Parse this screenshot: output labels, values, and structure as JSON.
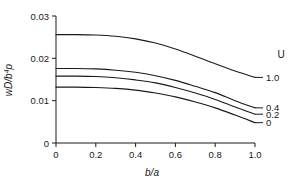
{
  "chart_data": {
    "type": "line",
    "title": "",
    "xlabel": "b/a",
    "ylabel": "wD/b4p",
    "ylabel_parts": {
      "pre": "wD/b",
      "sup": "4",
      "post": "p"
    },
    "xlim": [
      0,
      1.0
    ],
    "ylim": [
      0,
      0.03
    ],
    "grid": false,
    "legend_title": "U",
    "legend_position": "right-outside-curve-ends",
    "x_ticks": [
      0,
      0.2,
      0.4,
      0.6,
      0.8,
      1.0
    ],
    "x_tick_labels": [
      "0",
      "0.2",
      "0.4",
      "0.6",
      "0.8",
      "1.0"
    ],
    "y_ticks": [
      0,
      0.01,
      0.02,
      0.03
    ],
    "y_tick_labels": [
      "0",
      "0.01",
      "0.02",
      "0.03"
    ],
    "x": [
      0,
      0.1,
      0.2,
      0.3,
      0.4,
      0.5,
      0.6,
      0.7,
      0.8,
      0.9,
      1.0
    ],
    "series": [
      {
        "name": "1.0",
        "label": "1.0",
        "values": [
          0.0256,
          0.0256,
          0.0255,
          0.0252,
          0.0246,
          0.0236,
          0.0222,
          0.0205,
          0.0187,
          0.017,
          0.0155
        ]
      },
      {
        "name": "0.4",
        "label": "0.4",
        "values": [
          0.0176,
          0.0176,
          0.0175,
          0.0172,
          0.0167,
          0.0159,
          0.0148,
          0.0134,
          0.0119,
          0.01,
          0.0083
        ]
      },
      {
        "name": "0.2",
        "label": "0.2",
        "values": [
          0.0158,
          0.0158,
          0.0157,
          0.0154,
          0.0149,
          0.0142,
          0.0131,
          0.0118,
          0.0103,
          0.0085,
          0.0068
        ]
      },
      {
        "name": "0",
        "label": "0",
        "values": [
          0.0132,
          0.0132,
          0.0131,
          0.0129,
          0.0125,
          0.0118,
          0.0109,
          0.0097,
          0.0083,
          0.0066,
          0.0048
        ]
      }
    ],
    "colors": {
      "axis": "#1a1a1a",
      "curve": "#1a1a1a",
      "background": "#ffffff"
    }
  }
}
